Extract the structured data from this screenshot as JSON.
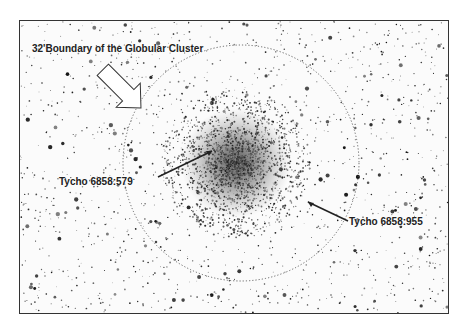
{
  "figure": {
    "boundary_label": "32'Boundary of the Globular Cluster",
    "star_labels": [
      {
        "name": "Tycho 6858:579"
      },
      {
        "name": "Tycho 6858:955"
      }
    ],
    "colors": {
      "background": "#fbfbfb",
      "stars": "#222222",
      "frame": "#333333"
    }
  }
}
